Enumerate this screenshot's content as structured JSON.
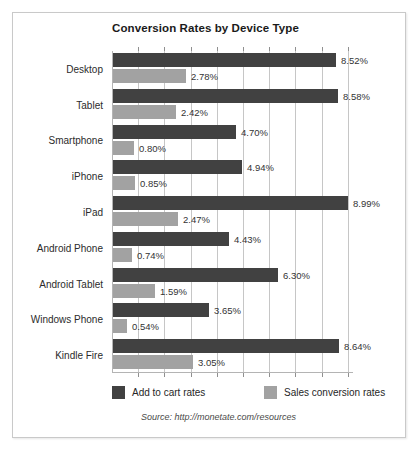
{
  "chart_data": {
    "type": "bar",
    "orientation": "horizontal",
    "title": "Conversion Rates by Device Type",
    "xlabel": "",
    "ylabel": "",
    "xlim": [
      0,
      9.2
    ],
    "grid": true,
    "gridline_step": 1,
    "legend_position": "bottom",
    "categories": [
      "Desktop",
      "Tablet",
      "Smartphone",
      "iPhone",
      "iPad",
      "Android Phone",
      "Android Tablet",
      "Windows Phone",
      "Kindle Fire"
    ],
    "series": [
      {
        "name": "Add to cart rates",
        "color": "#414141",
        "values": [
          8.52,
          8.58,
          4.7,
          4.94,
          8.99,
          4.43,
          6.3,
          3.65,
          8.64
        ],
        "labels": [
          "8.52%",
          "8.58%",
          "4.70%",
          "4.94%",
          "8.99%",
          "4.43%",
          "6.30%",
          "3.65%",
          "8.64%"
        ]
      },
      {
        "name": "Sales conversion rates",
        "color": "#a2a2a2",
        "values": [
          2.78,
          2.42,
          0.8,
          0.85,
          2.47,
          0.74,
          1.59,
          0.54,
          3.05
        ],
        "labels": [
          "2.78%",
          "2.42%",
          "0.80%",
          "0.85%",
          "2.47%",
          "0.74%",
          "1.59%",
          "0.54%",
          "3.05%"
        ]
      }
    ],
    "annotations": {
      "source": "Source: http://monetate.com/resources"
    }
  }
}
